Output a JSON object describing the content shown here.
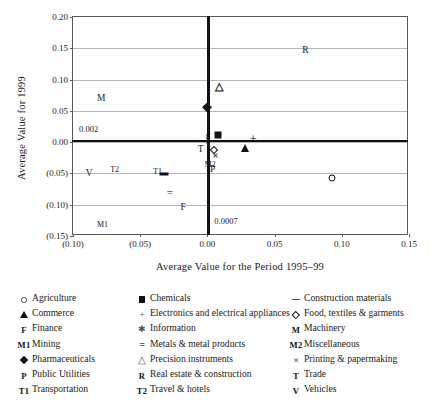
{
  "chart_data": {
    "type": "scatter",
    "title": "",
    "xlabel": "Average Value for the Period 1995–99",
    "ylabel": "Average Value for 1999",
    "xlim": [
      -0.1,
      0.15
    ],
    "ylim": [
      -0.15,
      0.2
    ],
    "grid": true,
    "legend_position": "below",
    "xticks": [
      "(0.10)",
      "(0.05)",
      "0.00",
      "0.05",
      "0.10",
      "0.15"
    ],
    "xtick_values": [
      -0.1,
      -0.05,
      0.0,
      0.05,
      0.1,
      0.15
    ],
    "yticks": [
      "0.20",
      "0.15",
      "0.10",
      "0.05",
      "0.00",
      "(0.05)",
      "(0.10)",
      "(0.15)"
    ],
    "ytick_values": [
      0.2,
      0.15,
      0.1,
      0.05,
      0.0,
      -0.05,
      -0.1,
      -0.15
    ],
    "reference_lines": {
      "horizontal_value": 0.002,
      "horizontal_label": "0.002",
      "vertical_value": 0.0007,
      "vertical_label": "0.0007"
    },
    "points": [
      {
        "name": "Agriculture",
        "symbol": "circle-open",
        "x": 0.093,
        "y": -0.057
      },
      {
        "name": "Chemicals",
        "symbol": "square-fill",
        "x": 0.008,
        "y": 0.012
      },
      {
        "name": "Construction materials",
        "symbol": "dash",
        "x": -0.032,
        "y": -0.051
      },
      {
        "name": "Commerce",
        "symbol": "triangle-fill",
        "x": 0.028,
        "y": -0.009
      },
      {
        "name": "Electronics and electrical appliances",
        "symbol": "plus",
        "x": 0.034,
        "y": 0.006
      },
      {
        "name": "Food, textiles & garments",
        "symbol": "diamond-open",
        "x": 0.005,
        "y": -0.012
      },
      {
        "name": "Finance",
        "symbol": "letter-F",
        "x": -0.018,
        "y": -0.106
      },
      {
        "name": "Information",
        "symbol": "letter-I",
        "x": 0.0,
        "y": 0.0
      },
      {
        "name": "Machinery",
        "symbol": "letter-M",
        "x": -0.079,
        "y": 0.069
      },
      {
        "name": "Metals & metal products",
        "symbol": "equals",
        "x": -0.028,
        "y": -0.079
      },
      {
        "name": "Mining",
        "symbol": "letter-M1",
        "x": -0.078,
        "y": -0.133
      },
      {
        "name": "Miscellaneous",
        "symbol": "letter-M2",
        "x": 0.002,
        "y": -0.036
      },
      {
        "name": "Pharmaceuticals",
        "symbol": "diamond-fill",
        "x": 0.0,
        "y": 0.056
      },
      {
        "name": "Printing & papermaking",
        "symbol": "x-cross",
        "x": 0.0005,
        "y": 0.01
      },
      {
        "name": "Printing & papermaking 2",
        "symbol": "x-cross",
        "x": 0.006,
        "y": -0.021
      },
      {
        "name": "Precision instruments",
        "symbol": "triangle-open",
        "x": 0.009,
        "y": 0.089
      },
      {
        "name": "Public Utilities",
        "symbol": "letter-P",
        "x": 0.004,
        "y": -0.044
      },
      {
        "name": "Real estate & construction",
        "symbol": "letter-R",
        "x": 0.073,
        "y": 0.145
      },
      {
        "name": "Trade",
        "symbol": "letter-T",
        "x": -0.005,
        "y": -0.012
      },
      {
        "name": "Transportation",
        "symbol": "letter-T1",
        "x": -0.037,
        "y": -0.047
      },
      {
        "name": "Travel & hotels",
        "symbol": "letter-T2",
        "x": -0.069,
        "y": -0.045
      },
      {
        "name": "Vehicles",
        "symbol": "letter-V",
        "x": -0.088,
        "y": -0.051
      }
    ]
  },
  "axes": {
    "y_title": "Average Value for 1999",
    "x_title": "Average Value for the Period 1995–99",
    "y_ticks": [
      "0.20",
      "0.15",
      "0.10",
      "0.05",
      "0.00",
      "(0.05)",
      "(0.10)",
      "(0.15)"
    ],
    "x_ticks": [
      "(0.10)",
      "(0.05)",
      "0.00",
      "0.05",
      "0.10",
      "0.15"
    ]
  },
  "annotations": {
    "h_line_value": "0.002",
    "v_line_value": "0.0007"
  },
  "plot_labels": {
    "R": "R",
    "M": "M",
    "V": "V",
    "T": "T",
    "T1": "T1",
    "T2": "T2",
    "F": "F",
    "M1": "M1",
    "M2": "M2",
    "P": "P",
    "equals": "="
  },
  "legend": {
    "columns": [
      {
        "items": [
          {
            "symbol": "circle-open",
            "label": "Agriculture"
          },
          {
            "symbol": "triangle-fill",
            "label": "Commerce"
          },
          {
            "symbol": "letter-F",
            "label": "Finance"
          },
          {
            "symbol": "letter-M1",
            "label": "Mining"
          },
          {
            "symbol": "diamond-fill",
            "label": "Pharmaceuticals"
          },
          {
            "symbol": "letter-P",
            "label": "Public Utilities"
          },
          {
            "symbol": "letter-T1",
            "label": "Transportation"
          }
        ]
      },
      {
        "items": [
          {
            "symbol": "square-fill",
            "label": "Chemicals"
          },
          {
            "symbol": "plus",
            "label": "Electronics and electrical appliances"
          },
          {
            "symbol": "star",
            "label": "Information"
          },
          {
            "symbol": "equals",
            "label": "Metals & metal products"
          },
          {
            "symbol": "triangle-open",
            "label": "Precision instruments"
          },
          {
            "symbol": "letter-R",
            "label": "Real estate & construction"
          },
          {
            "symbol": "letter-T2",
            "label": "Travel & hotels"
          }
        ]
      },
      {
        "items": [
          {
            "symbol": "dash",
            "label": "Construction materials"
          },
          {
            "symbol": "diamond-open",
            "label": "Food, textiles & garments"
          },
          {
            "symbol": "letter-M",
            "label": "Machinery"
          },
          {
            "symbol": "letter-M2",
            "label": "Miscellaneous"
          },
          {
            "symbol": "x-cross",
            "label": "Printing & papermaking"
          },
          {
            "symbol": "letter-T",
            "label": "Trade"
          },
          {
            "symbol": "letter-V",
            "label": "Vehicles"
          }
        ]
      }
    ]
  }
}
